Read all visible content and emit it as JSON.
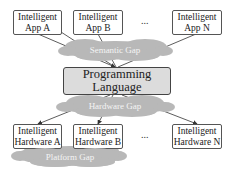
{
  "diagram": {
    "apps": [
      {
        "line1": "Intelligent",
        "line2": "App A"
      },
      {
        "line1": "Intelligent",
        "line2": "App B"
      },
      {
        "line1": "Intelligent",
        "line2": "App N"
      }
    ],
    "apps_ellipsis": "...",
    "semantic_gap": "Semantic Gap",
    "language": {
      "line1": "Programming",
      "line2": "Language"
    },
    "hardware_gap": "Hardware Gap",
    "hardware": [
      {
        "line1": "Intelligent",
        "line2": "Hardware A"
      },
      {
        "line1": "Intelligent",
        "line2": "Hardware B"
      },
      {
        "line1": "Intelligent",
        "line2": "Hardware N"
      }
    ],
    "hardware_ellipsis": "...",
    "platform_gap": "Platform Gap",
    "colors": {
      "cloud": "#b8b8b8",
      "language_fill": "#dcdcdc",
      "box_border": "#555555",
      "arrow": "#333333"
    }
  }
}
